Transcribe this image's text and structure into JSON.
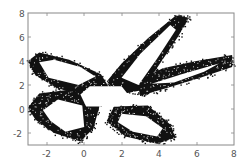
{
  "chart_data": {
    "type": "scatter",
    "title": "",
    "xlabel": "",
    "ylabel": "",
    "xlim": [
      -3,
      8
    ],
    "ylim": [
      -3,
      8
    ],
    "grid": false,
    "legend": null,
    "x_ticks": [
      -2,
      0,
      2,
      4,
      6,
      8
    ],
    "y_ticks": [
      -2,
      0,
      2,
      4,
      6,
      8
    ],
    "x_tick_labels": [
      "-2",
      "0",
      "2",
      "4",
      "6",
      "8"
    ],
    "y_tick_labels": [
      "-2",
      "0",
      "2",
      "4",
      "6",
      "8"
    ],
    "marker_color": "#000000",
    "central_hole": [
      [
        -0.2,
        1.2
      ],
      [
        0.3,
        1.9
      ],
      [
        2.0,
        1.9
      ],
      [
        2.4,
        1.1
      ],
      [
        1.9,
        0.2
      ],
      [
        0.1,
        0.2
      ]
    ],
    "lobes": [
      {
        "name": "upper-left",
        "outer": [
          [
            -3.0,
            4.0
          ],
          [
            -2.4,
            4.7
          ],
          [
            -0.8,
            4.1
          ],
          [
            0.9,
            2.9
          ],
          [
            1.4,
            1.6
          ],
          [
            0.0,
            1.0
          ],
          [
            -1.5,
            1.8
          ],
          [
            -2.6,
            2.8
          ]
        ],
        "inner": [
          [
            -2.4,
            3.9
          ],
          [
            -1.6,
            4.1
          ],
          [
            -0.2,
            3.5
          ],
          [
            0.6,
            2.7
          ],
          [
            -0.3,
            2.0
          ],
          [
            -1.9,
            2.6
          ]
        ]
      },
      {
        "name": "upper-right",
        "outer": [
          [
            1.2,
            2.3
          ],
          [
            2.0,
            3.8
          ],
          [
            3.4,
            5.9
          ],
          [
            4.9,
            7.8
          ],
          [
            5.6,
            7.6
          ],
          [
            5.0,
            6.0
          ],
          [
            3.8,
            3.2
          ],
          [
            3.2,
            1.6
          ],
          [
            1.9,
            1.2
          ]
        ],
        "inner": [
          [
            2.0,
            2.6
          ],
          [
            3.0,
            4.6
          ],
          [
            4.6,
            7.0
          ],
          [
            4.9,
            6.6
          ],
          [
            3.9,
            4.2
          ],
          [
            2.9,
            2.0
          ]
        ]
      },
      {
        "name": "right",
        "outer": [
          [
            2.8,
            2.3
          ],
          [
            4.2,
            3.4
          ],
          [
            6.0,
            4.0
          ],
          [
            7.9,
            4.5
          ],
          [
            7.9,
            3.5
          ],
          [
            6.2,
            2.6
          ],
          [
            4.5,
            1.8
          ],
          [
            3.0,
            1.1
          ]
        ],
        "inner": [
          [
            3.6,
            2.1
          ],
          [
            5.2,
            2.9
          ],
          [
            7.2,
            3.8
          ],
          [
            6.4,
            3.1
          ],
          [
            4.8,
            2.2
          ]
        ]
      },
      {
        "name": "lower-left",
        "outer": [
          [
            -3.0,
            0.1
          ],
          [
            -2.4,
            1.3
          ],
          [
            -0.8,
            1.6
          ],
          [
            0.9,
            0.7
          ],
          [
            0.5,
            -1.6
          ],
          [
            -0.2,
            -2.7
          ],
          [
            -1.6,
            -2.0
          ],
          [
            -2.6,
            -0.9
          ]
        ],
        "inner": [
          [
            -2.2,
            -0.1
          ],
          [
            -1.4,
            0.8
          ],
          [
            -0.1,
            0.3
          ],
          [
            0.0,
            -1.5
          ],
          [
            -1.0,
            -1.9
          ],
          [
            -1.8,
            -1.0
          ]
        ]
      },
      {
        "name": "lower-right",
        "outer": [
          [
            1.6,
            0.2
          ],
          [
            3.4,
            0.3
          ],
          [
            4.6,
            -1.3
          ],
          [
            4.9,
            -2.4
          ],
          [
            3.9,
            -2.9
          ],
          [
            2.2,
            -2.3
          ],
          [
            1.2,
            -1.0
          ]
        ],
        "inner": [
          [
            2.0,
            -0.4
          ],
          [
            3.3,
            -0.6
          ],
          [
            4.2,
            -1.6
          ],
          [
            3.9,
            -2.3
          ],
          [
            2.6,
            -1.9
          ],
          [
            1.8,
            -1.1
          ]
        ]
      }
    ]
  },
  "axes": {
    "x_labels": [
      "-2",
      "0",
      "2",
      "4",
      "6",
      "8"
    ],
    "y_labels": [
      "8",
      "6",
      "4",
      "2",
      "0",
      "-2"
    ]
  }
}
